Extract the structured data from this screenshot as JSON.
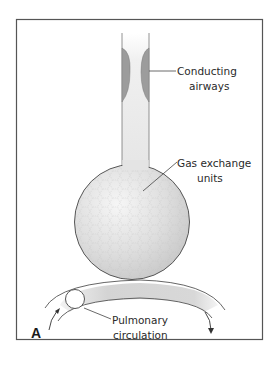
{
  "figure": {
    "panel_label": "A",
    "labels": {
      "conducting_airways": [
        "Conducting",
        "airways"
      ],
      "gas_exchange_units": [
        "Gas exchange",
        "units"
      ],
      "pulmonary_circulation": [
        "Pulmonary",
        "circulation"
      ]
    },
    "colors": {
      "frame": "#555555",
      "tube_fill": "#ececec",
      "airway_smooth_muscle": "#9a9a9a",
      "alveolar_sphere": "#d6d6d6",
      "vessel_fill": "#d9d9d9",
      "outline": "#555555"
    }
  }
}
